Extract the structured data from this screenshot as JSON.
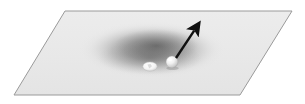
{
  "figure": {
    "title": "Gravity well on a deformed plane with orbiting body and velocity vector",
    "background_color": "#ffffff",
    "width": 305,
    "height": 104
  },
  "plane": {
    "name": "spacetime-plane",
    "shape": "parallelogram",
    "corners": [
      {
        "x": 65,
        "y": 11
      },
      {
        "x": 292,
        "y": 11
      },
      {
        "x": 240,
        "y": 95
      },
      {
        "x": 14,
        "y": 95
      }
    ],
    "fill_color": "#e9e9e9",
    "edge_color": "#9a9a9a",
    "edge_width": 1
  },
  "gravity_well": {
    "name": "gravity-well-depression",
    "shape": "ellipse",
    "center": {
      "x": 152,
      "y": 50
    },
    "radius_x": 72,
    "radius_y": 28,
    "core_color": "#6f6f6f",
    "mid_color": "#9d9d9d",
    "edge_color": "#e9e9e9"
  },
  "bodies": [
    {
      "name": "irregular-white-object",
      "kind": "irregular",
      "center": {
        "x": 150,
        "y": 66
      },
      "radius_x": 7,
      "radius_y": 4.5,
      "fill_color": "#fbfbfb",
      "outline_color": "#b9b9b9"
    },
    {
      "name": "white-sphere",
      "kind": "sphere",
      "center": {
        "x": 172,
        "y": 62
      },
      "radius": 6,
      "fill_color": "#f7f7f7",
      "highlight_color": "#ffffff",
      "shade_color": "#b5b5b5"
    }
  ],
  "vector_arrow": {
    "name": "velocity-vector-arrow",
    "start": {
      "x": 176,
      "y": 58
    },
    "end": {
      "x": 196,
      "y": 28
    },
    "color": "#101010",
    "line_width": 2.4,
    "head_length": 11,
    "head_width": 9
  }
}
